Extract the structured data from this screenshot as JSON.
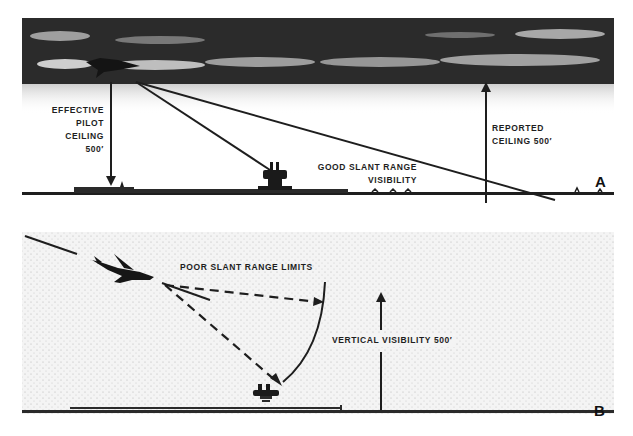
{
  "panel_a": {
    "letter": "A",
    "labels": {
      "effective_pilot_ceiling": [
        "EFFECTIVE",
        "PILOT",
        "CEILING",
        "500′"
      ],
      "good_slant_range": [
        "GOOD SLANT RANGE",
        "VISIBILITY"
      ],
      "reported_ceiling": [
        "REPORTED",
        "CEILING 500′"
      ]
    }
  },
  "panel_b": {
    "letter": "B",
    "labels": {
      "poor_slant_range": "POOR SLANT RANGE LIMITS",
      "vertical_visibility": "VERTICAL VISIBILITY 500′"
    }
  },
  "colors": {
    "ink": "#1e1e1e",
    "cloud_dark": "#2a2a2a",
    "cloud_light": "#bdbdbd",
    "fog": "#e9e9e9",
    "background": "#ffffff"
  }
}
